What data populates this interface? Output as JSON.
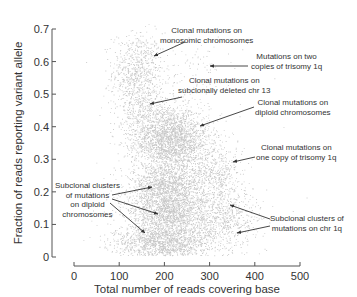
{
  "chart_data": {
    "type": "scatter",
    "title": "",
    "xlabel": "Total number of reads covering base",
    "ylabel": "Fraction of reads reporting variant allele",
    "xlim": [
      0,
      500
    ],
    "ylim": [
      0,
      0.7
    ],
    "xticks": [
      0,
      100,
      200,
      300,
      400,
      500
    ],
    "yticks": [
      0,
      0.1,
      0.2,
      0.3,
      0.4,
      0.5,
      0.6,
      0.7
    ],
    "xtick_labels": [
      "0",
      "100",
      "200",
      "300",
      "400",
      "500"
    ],
    "ytick_labels": [
      "0",
      "0.1",
      "0.2",
      "0.3",
      "0.4",
      "0.5",
      "0.6",
      "0.7"
    ],
    "grid": false,
    "legend": null,
    "point_color": "#3a3a3a",
    "clusters": [
      {
        "name": "Clonal mutations on monosomic chromosomes",
        "center": [
          140,
          0.57
        ],
        "spread": [
          28,
          0.06
        ],
        "weight": 0.08
      },
      {
        "name": "Clonal mutations on diploid chromosomes",
        "center": [
          215,
          0.36
        ],
        "spread": [
          42,
          0.05
        ],
        "weight": 0.26
      },
      {
        "name": "Subclonal clusters on diploid chromosomes (upper)",
        "center": [
          205,
          0.21
        ],
        "spread": [
          40,
          0.035
        ],
        "weight": 0.16
      },
      {
        "name": "Subclonal clusters on diploid chromosomes (middle)",
        "center": [
          210,
          0.13
        ],
        "spread": [
          45,
          0.03
        ],
        "weight": 0.14
      },
      {
        "name": "Subclonal clusters on diploid chromosomes (lower)",
        "center": [
          200,
          0.05
        ],
        "spread": [
          55,
          0.025
        ],
        "weight": 0.16
      },
      {
        "name": "Clonal mutations on subclonally deleted chr 13",
        "center": [
          150,
          0.45
        ],
        "spread": [
          30,
          0.05
        ],
        "weight": 0.04
      },
      {
        "name": "Clonal mutations on one copy of trisomy 1q",
        "center": [
          310,
          0.26
        ],
        "spread": [
          30,
          0.04
        ],
        "weight": 0.05
      },
      {
        "name": "Subclonal clusters of mutations on chr 1q",
        "center": [
          330,
          0.12
        ],
        "spread": [
          40,
          0.045
        ],
        "weight": 0.07
      },
      {
        "name": "Mutations on two copies of trisomy 1q",
        "center": [
          270,
          0.58
        ],
        "spread": [
          40,
          0.05
        ],
        "weight": 0.01
      },
      {
        "name": "Background",
        "center": [
          220,
          0.25
        ],
        "spread": [
          90,
          0.15
        ],
        "weight": 0.03
      }
    ],
    "annotations": [
      {
        "text": "Clonal mutations on\nmonosomic chromosomes",
        "arrow_to": [
          130,
          0.59
        ]
      },
      {
        "text": "Mutations on two\ncopies of trisomy 1q",
        "arrow_to": [
          200,
          0.585
        ]
      },
      {
        "text": "Clonal mutations on\nsubclonally deleted chr 13",
        "arrow_to": [
          134,
          0.47
        ]
      },
      {
        "text": "Clonal mutations on\ndiploid chromosomes",
        "arrow_to": [
          235,
          0.405
        ]
      },
      {
        "text": "Clonal mutations on\none copy of trisomy 1q",
        "arrow_to": [
          350,
          0.29
        ]
      },
      {
        "text": "Subclonal clusters of\nmutations on diploid\nchromosomes",
        "arrow_to": [
          [
            172,
            0.215
          ],
          [
            186,
            0.13
          ],
          [
            157,
            0.073
          ]
        ]
      },
      {
        "text": "Subclonal clusters of\nmutations on chr 1q",
        "arrow_to": [
          [
            346,
            0.165
          ],
          [
            362,
            0.073
          ]
        ]
      }
    ]
  },
  "annotations": {
    "monosomic": [
      "Clonal mutations on",
      "monosomic chromosomes"
    ],
    "trisomy_two": [
      "Mutations on two",
      "copies of trisomy 1q"
    ],
    "chr13": [
      "Clonal mutations on",
      "subclonally deleted chr 13"
    ],
    "diploid": [
      "Clonal mutations on",
      "diploid chromosomes"
    ],
    "trisomy_one": [
      "Clonal mutations on",
      "one copy of trisomy 1q"
    ],
    "subclonal_diploid": [
      "Subclonal clusters",
      "of mutations",
      "on diploid",
      "chromosomes"
    ],
    "subclonal_1q": [
      "Subclonal clusters of",
      "mutations on chr 1q"
    ]
  }
}
